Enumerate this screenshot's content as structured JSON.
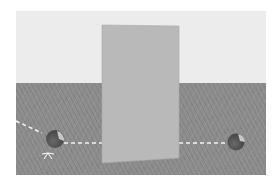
{
  "scene": {
    "description": "3D render: upright gray panel on wood floor with two balls and dashed trajectory line",
    "colors": {
      "wall": "#ececec",
      "floor": "#8d8d8d",
      "panel": "#b9b9b9",
      "ball_dark": "#5a5a5a",
      "ball_light": "#c8c8c8",
      "path": "#f4f4f4"
    },
    "objects": [
      {
        "name": "occluder-panel",
        "type": "panel"
      },
      {
        "name": "ball-left",
        "type": "ball"
      },
      {
        "name": "ball-right",
        "type": "ball"
      },
      {
        "name": "trajectory-path",
        "type": "dashed-line"
      },
      {
        "name": "impact-spark",
        "type": "marker"
      }
    ]
  }
}
